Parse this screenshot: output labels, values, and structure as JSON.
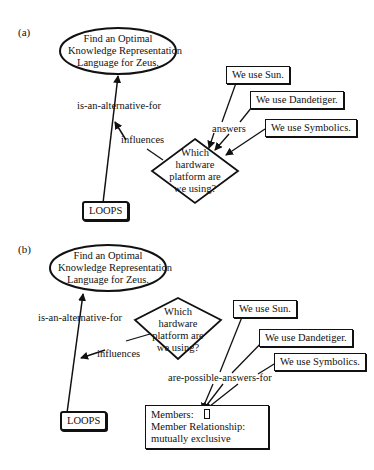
{
  "figure": {
    "panels": [
      {
        "label": "(a)",
        "goal": [
          "Find an Optimal",
          "Knowledge Representation",
          "Language for Zeus."
        ],
        "question": [
          "Which",
          "hardware",
          "platform are",
          "we using?"
        ],
        "alternative": "LOOPS",
        "answers": [
          "We use  Sun.",
          "We use Dandetiger.",
          "We use Symbolics."
        ],
        "links": {
          "alternative": "is-an-alternative-for",
          "influences": "influences",
          "answers": "answers"
        }
      },
      {
        "label": "(b)",
        "goal": [
          "Find an Optimal",
          "Knowledge Representation",
          "Language for Zeus."
        ],
        "question": [
          "Which",
          "hardware",
          "platform are",
          "we using?"
        ],
        "alternative": "LOOPS",
        "answers": [
          "We use  Sun.",
          "We use Dandetiger.",
          "We use Symbolics."
        ],
        "links": {
          "alternative": "is-an-alternative-for",
          "influences": "influences",
          "answers": "are-possible-answers-for"
        },
        "set_node": {
          "members_label": "Members:",
          "relationship_label": "Member Relationship:",
          "relationship_value": "mutually exclusive"
        }
      }
    ]
  }
}
